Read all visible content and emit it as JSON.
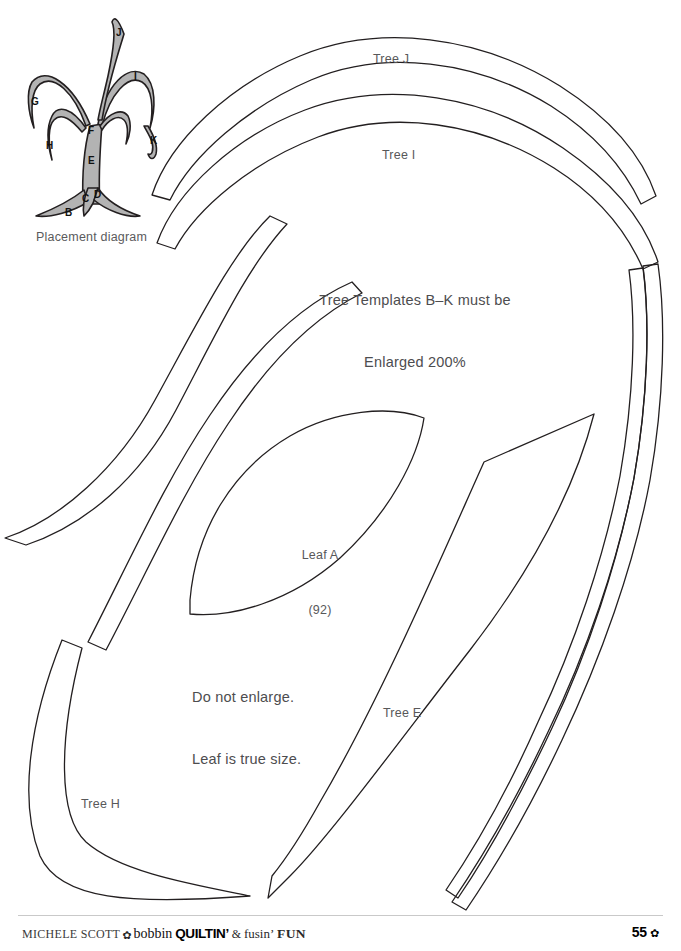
{
  "page": {
    "width": 681,
    "height": 951,
    "background": "#ffffff",
    "outline_color": "#231f20",
    "text_color": "#58585a"
  },
  "placement_diagram": {
    "caption": "Placement diagram",
    "fill_color": "#b3b3b3",
    "stroke_color": "#231f20",
    "piece_labels": [
      {
        "id": "B",
        "label": "B",
        "x": 55,
        "y": 208
      },
      {
        "id": "C",
        "label": "C",
        "x": 82,
        "y": 194
      },
      {
        "id": "D",
        "label": "D",
        "x": 94,
        "y": 190
      },
      {
        "id": "E",
        "label": "E",
        "x": 88,
        "y": 155
      },
      {
        "id": "F",
        "label": "F",
        "x": 88,
        "y": 124
      },
      {
        "id": "G",
        "label": "G",
        "x": 31,
        "y": 96
      },
      {
        "id": "H",
        "label": "H",
        "x": 46,
        "y": 140
      },
      {
        "id": "I",
        "label": "I",
        "x": 133,
        "y": 71
      },
      {
        "id": "J",
        "label": "J",
        "x": 115,
        "y": 27
      },
      {
        "id": "K",
        "label": "K",
        "x": 150,
        "y": 136
      }
    ]
  },
  "templates": [
    {
      "id": "tree-j",
      "label": "Tree J",
      "x": 396,
      "y": 57
    },
    {
      "id": "tree-i",
      "label": "Tree I",
      "x": 405,
      "y": 153
    },
    {
      "id": "leaf-a",
      "label": "Leaf A",
      "sublabel": "(92)",
      "x": 314,
      "y": 518
    },
    {
      "id": "tree-e",
      "label": "Tree E",
      "x": 404,
      "y": 711
    },
    {
      "id": "tree-h",
      "label": "Tree H",
      "x": 102,
      "y": 802
    }
  ],
  "notes": [
    {
      "id": "enlargement-note",
      "line1": "Tree Templates B–K must be",
      "line2": "Enlarged 200%",
      "x": 415,
      "y": 258
    },
    {
      "id": "leaf-note",
      "line1": "Do not enlarge.",
      "line2": "Leaf is true size.",
      "x": 192,
      "y": 655
    }
  ],
  "footer": {
    "author": "MICHELE SCOTT",
    "flower_icon": "✿",
    "brand_1": "bobbin",
    "brand_2": "QUILTIN",
    "apostrophe": "’",
    "amp": "&",
    "brand_3": "fusin’",
    "brand_4": "FUN",
    "page_number": "55",
    "page_flower_icon": "✿"
  }
}
